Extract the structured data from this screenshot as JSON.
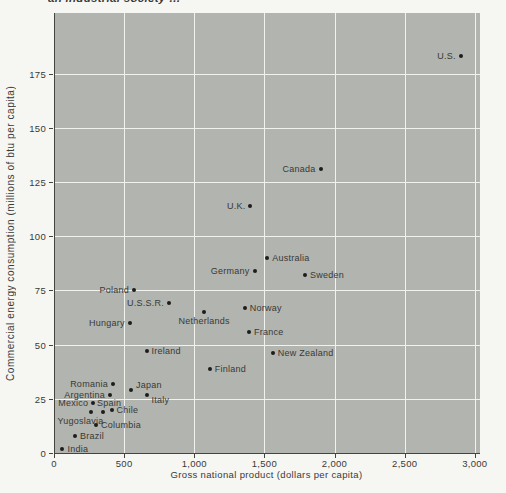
{
  "page": {
    "clipped_text": "an industrial society …"
  },
  "chart_data": {
    "type": "scatter",
    "title": "",
    "xlabel": "Gross national product (dollars per capita)",
    "ylabel": "Commercial energy consumption (millions of btu per capita)",
    "xlim": [
      0,
      3030
    ],
    "ylim": [
      0,
      203
    ],
    "grid": true,
    "legend": "none",
    "panel_color": "#b2b4af",
    "grid_color": "#f2f2ec",
    "axis_color": "#45453f",
    "point_color": "#1d1d1b",
    "label_color": "#393935",
    "x_ticks": [
      {
        "value": 0,
        "label": "0"
      },
      {
        "value": 500,
        "label": "500"
      },
      {
        "value": 1000,
        "label": "1,000"
      },
      {
        "value": 1500,
        "label": "1,500"
      },
      {
        "value": 2000,
        "label": "2,000"
      },
      {
        "value": 2500,
        "label": "2,500"
      },
      {
        "value": 3000,
        "label": "3,000"
      }
    ],
    "y_ticks": [
      {
        "value": 0,
        "label": "0"
      },
      {
        "value": 25,
        "label": "25"
      },
      {
        "value": 50,
        "label": "50"
      },
      {
        "value": 75,
        "label": "75"
      },
      {
        "value": 100,
        "label": "100"
      },
      {
        "value": 125,
        "label": "125"
      },
      {
        "value": 150,
        "label": "150"
      },
      {
        "value": 175,
        "label": "175"
      }
    ],
    "points": [
      {
        "name": "U.S.",
        "x": 2900,
        "y": 183,
        "label_side": "left"
      },
      {
        "name": "Canada",
        "x": 1900,
        "y": 131,
        "label_side": "left"
      },
      {
        "name": "U.K.",
        "x": 1400,
        "y": 114,
        "label_side": "left"
      },
      {
        "name": "Australia",
        "x": 1520,
        "y": 90,
        "label_side": "right"
      },
      {
        "name": "Germany",
        "x": 1430,
        "y": 84,
        "label_side": "left"
      },
      {
        "name": "Sweden",
        "x": 1790,
        "y": 82,
        "label_side": "right"
      },
      {
        "name": "Poland",
        "x": 570,
        "y": 75,
        "label_side": "left"
      },
      {
        "name": "U.S.S.R.",
        "x": 820,
        "y": 69,
        "label_side": "left"
      },
      {
        "name": "Norway",
        "x": 1360,
        "y": 67,
        "label_side": "right"
      },
      {
        "name": "Netherlands",
        "x": 1070,
        "y": 65,
        "label_side": "below"
      },
      {
        "name": "Hungary",
        "x": 540,
        "y": 60,
        "label_side": "left"
      },
      {
        "name": "France",
        "x": 1390,
        "y": 56,
        "label_side": "right"
      },
      {
        "name": "Ireland",
        "x": 660,
        "y": 47,
        "label_side": "right"
      },
      {
        "name": "New Zealand",
        "x": 1560,
        "y": 46,
        "label_side": "right"
      },
      {
        "name": "Finland",
        "x": 1110,
        "y": 39,
        "label_side": "right"
      },
      {
        "name": "Romania",
        "x": 420,
        "y": 32,
        "label_side": "left"
      },
      {
        "name": "Japan",
        "x": 550,
        "y": 29,
        "label_side": "right",
        "dy": -5
      },
      {
        "name": "Argentina",
        "x": 400,
        "y": 27,
        "label_side": "left"
      },
      {
        "name": "Italy",
        "x": 660,
        "y": 27,
        "label_side": "right",
        "dy": 5
      },
      {
        "name": "Mexico",
        "x": 280,
        "y": 23,
        "label_side": "left"
      },
      {
        "name": "Chile",
        "x": 410,
        "y": 20,
        "label_side": "right"
      },
      {
        "name": "Spain",
        "x": 350,
        "y": 19,
        "label_side": "above",
        "dx": 6
      },
      {
        "name": "Yugoslavia",
        "x": 260,
        "y": 19,
        "label_side": "below",
        "dx": -10
      },
      {
        "name": "Columbia",
        "x": 300,
        "y": 13,
        "label_side": "right"
      },
      {
        "name": "Brazil",
        "x": 150,
        "y": 8,
        "label_side": "right"
      },
      {
        "name": "India",
        "x": 60,
        "y": 2,
        "label_side": "right"
      }
    ]
  }
}
